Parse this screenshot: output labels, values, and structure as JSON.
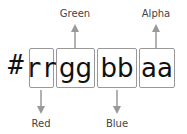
{
  "prefix": "#",
  "components": [
    {
      "code": "rr",
      "label": "Red",
      "position": "below"
    },
    {
      "code": "gg",
      "label": "Green",
      "position": "above"
    },
    {
      "code": "bb",
      "label": "Blue",
      "position": "below"
    },
    {
      "code": "aa",
      "label": "Alpha",
      "position": "above"
    }
  ],
  "colors": {
    "arrow": "#999999",
    "border": "#999999"
  }
}
